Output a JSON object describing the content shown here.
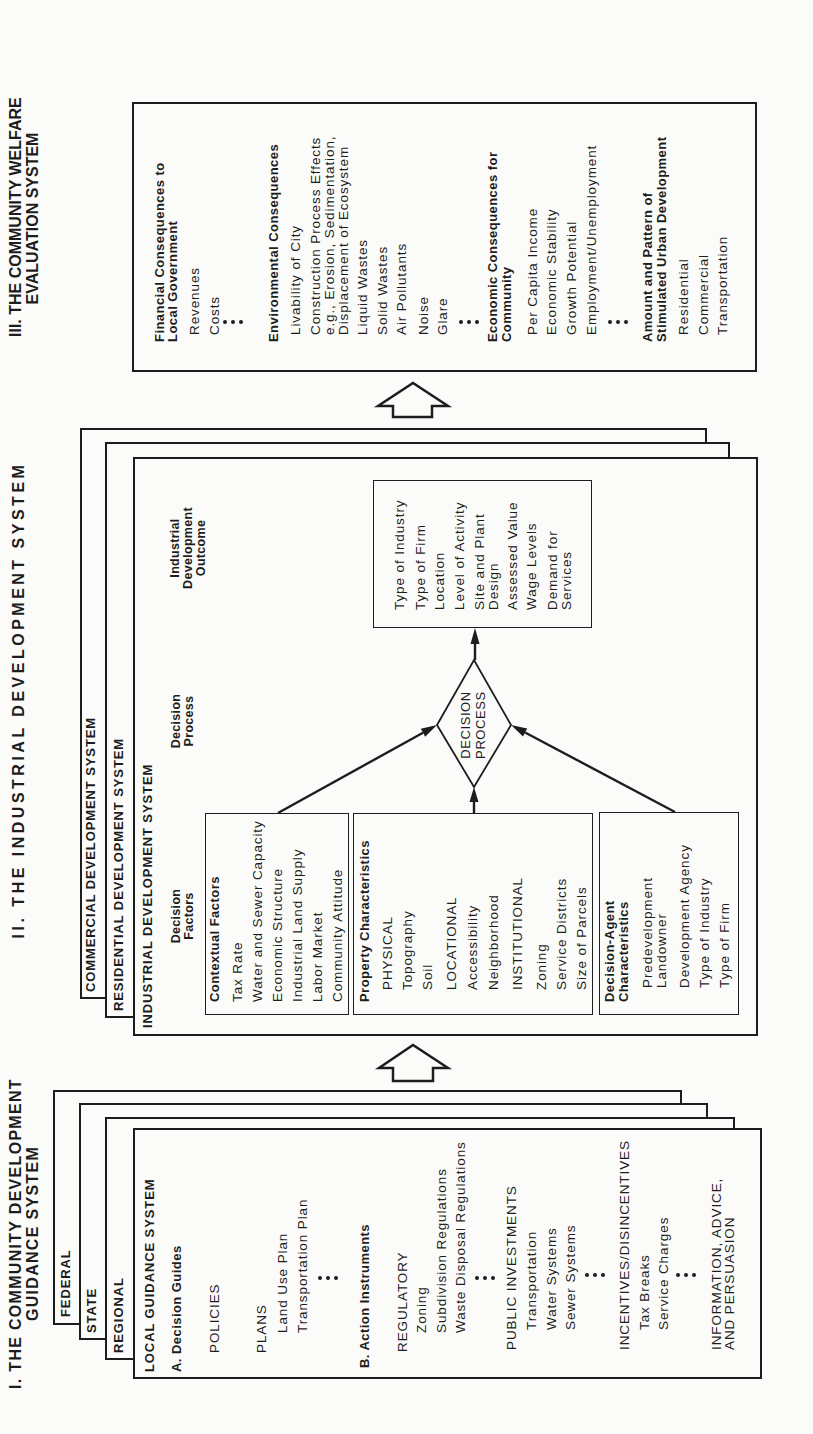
{
  "section_1": {
    "title": "I. THE COMMUNITY DEVELOPMENT\nGUIDANCE SYSTEM",
    "layers": {
      "federal": "FEDERAL",
      "state": "STATE",
      "regional": "REGIONAL",
      "local": "LOCAL GUIDANCE SYSTEM"
    },
    "decision_guides": {
      "heading": "A. Decision Guides",
      "policies": "POLICIES",
      "plans_label": "PLANS",
      "plans": [
        "Land Use Plan",
        "Transportation Plan"
      ]
    },
    "action_instruments": {
      "heading": "B. Action Instruments",
      "regulatory": {
        "label": "REGULATORY",
        "items": [
          "Zoning",
          "Subdivision Regulations",
          "Waste Disposal Regulations"
        ]
      },
      "public_investments": {
        "label": "PUBLIC INVESTMENTS",
        "items": [
          "Transportation",
          "Water Systems",
          "Sewer Systems"
        ]
      },
      "incentives": {
        "label": "INCENTIVES/DISINCENTIVES",
        "items": [
          "Tax Breaks",
          "Service Charges"
        ]
      },
      "information": {
        "label": "INFORMATION, ADVICE,\nAND PERSUASION"
      }
    }
  },
  "section_2": {
    "title": "II. THE INDUSTRIAL DEVELOPMENT SYSTEM",
    "layers": {
      "commercial": "COMMERCIAL DEVELOPMENT SYSTEM",
      "residential": "RESIDENTIAL DEVELOPMENT SYSTEM",
      "industrial": "INDUSTRIAL DEVELOPMENT SYSTEM"
    },
    "column_heads": {
      "factors": "Decision\nFactors",
      "process": "Decision\nProcess",
      "outcome": "Industrial\nDevelopment\nOutcome"
    },
    "contextual_factors": {
      "heading": "Contextual Factors",
      "items": [
        "Tax Rate",
        "Water and Sewer Capacity",
        "Economic Structure",
        "Industrial Land Supply",
        "Labor Market",
        "Community Attitude"
      ]
    },
    "property_characteristics": {
      "heading": "Property Characteristics",
      "physical": {
        "label": "PHYSICAL",
        "items": [
          "Topography",
          "Soil"
        ]
      },
      "locational": {
        "label": "LOCATIONAL",
        "items": [
          "Accessibility",
          "Neighborhood"
        ]
      },
      "institutional": {
        "label": "INSTITUTIONAL",
        "items": [
          "Zoning",
          "Service Districts",
          "Size of Parcels"
        ]
      }
    },
    "decision_agent": {
      "heading": "Decision-Agent\nCharacteristics",
      "items": [
        "Predevelopment\nLandowner",
        "Development Agency",
        "Type of Industry",
        "Type of Firm"
      ]
    },
    "decision_node": "DECISION\nPROCESS",
    "outcome": {
      "items": [
        "Type of Industry",
        "Type of Firm",
        "Location",
        "Level of Activity",
        "Site and Plant\nDesign",
        "Assessed Value",
        "Wage Levels",
        "Demand for\nServices"
      ]
    }
  },
  "section_3": {
    "title": "III. THE COMMUNITY WELFARE\nEVALUATION SYSTEM",
    "financial": {
      "heading": "Financial Consequences to\nLocal Government",
      "items": [
        "Revenues",
        "Costs"
      ]
    },
    "environmental": {
      "heading": "Environmental Consequences",
      "items": [
        "Livability of City",
        "Construction Process Effects\ne.g., Erosion, Sedimentation,\nDisplacement of Ecosystem",
        "Liquid Wastes",
        "Solid Wastes",
        "Air Pollutants",
        "Noise",
        "Glare"
      ]
    },
    "economic": {
      "heading": "Economic Consequences for\nCommunity",
      "items": [
        "Per Capita Income",
        "Economic Stability",
        "Growth Potential",
        "Employment/Unemployment"
      ]
    },
    "urban_development": {
      "heading": "Amount and Pattern of\nStimulated Urban Development",
      "items": [
        "Residential",
        "Commercial",
        "Transportation"
      ]
    }
  }
}
